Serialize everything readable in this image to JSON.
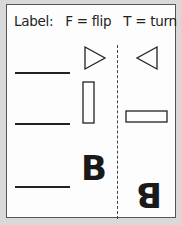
{
  "header": {
    "label": "Label:",
    "flip_key": "F = flip",
    "turn_key": "T = turn"
  },
  "rows": [
    {
      "left_shape": "triangle-right",
      "right_shape": "triangle-left",
      "answer_blank": ""
    },
    {
      "left_shape": "rectangle-vertical",
      "right_shape": "rectangle-horizontal",
      "answer_blank": ""
    },
    {
      "left_shape": "letter-B",
      "right_shape": "letter-B-upside-down",
      "answer_blank": "",
      "letter": "B"
    }
  ]
}
